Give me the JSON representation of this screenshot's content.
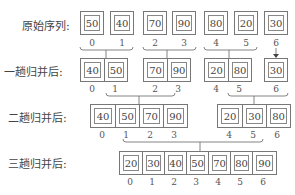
{
  "rows": [
    {
      "label": "原始序列:",
      "groups": [
        [
          "50"
        ],
        [
          "40"
        ],
        [
          "70"
        ],
        [
          "90"
        ],
        [
          "80"
        ],
        [
          "20"
        ],
        [
          "30"
        ]
      ]
    },
    {
      "label": "一趟归并后:",
      "groups": [
        [
          "40",
          "50"
        ],
        [
          "70",
          "90"
        ],
        [
          "20",
          "80"
        ],
        [
          "30"
        ]
      ]
    },
    {
      "label": "二趟归并后:",
      "groups": [
        [
          "40",
          "50",
          "70",
          "90"
        ],
        [
          "20",
          "30",
          "80"
        ]
      ]
    },
    {
      "label": "三趟归并后:",
      "groups": [
        [
          "20",
          "30",
          "40",
          "50",
          "70",
          "80",
          "90"
        ]
      ]
    }
  ],
  "indices": [
    "0",
    "1",
    "2",
    "3",
    "4",
    "5",
    "6"
  ]
}
